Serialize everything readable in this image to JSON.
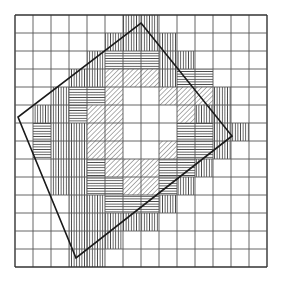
{
  "figure": {
    "background_color": "#ffffff",
    "grid": {
      "origin_x": 15,
      "origin_y": 15,
      "cell_size": 18,
      "cols": 14,
      "rows": 14,
      "line_color": "#555555",
      "line_width": 0.9,
      "border_color": "#333333",
      "border_width": 1.4
    },
    "polygon": {
      "name": "inscribed-quadrilateral",
      "stroke_color": "#1a1a1a",
      "stroke_width": 1.6,
      "fill": "none",
      "vertices": [
        {
          "label": "top",
          "x": 141,
          "y": 23
        },
        {
          "label": "right",
          "x": 232,
          "y": 136
        },
        {
          "label": "bottom",
          "x": 76,
          "y": 258
        },
        {
          "label": "left",
          "x": 18,
          "y": 117
        }
      ]
    },
    "hatch_styles": {
      "vertical": {
        "name": "vertical-hatch",
        "angle_deg": 90,
        "spacing": 2.6,
        "color": "#3a3a3a",
        "width": 0.8
      },
      "horizontal": {
        "name": "horizontal-hatch",
        "angle_deg": 0,
        "spacing": 2.6,
        "color": "#3a3a3a",
        "width": 0.8
      },
      "diagonal": {
        "name": "diagonal-hatch",
        "angle_deg": 45,
        "spacing": 3.4,
        "color": "#3a3a3a",
        "width": 0.8
      }
    },
    "hatched_cells": [
      {
        "col": 6,
        "row": 0,
        "pattern": "vertical"
      },
      {
        "col": 7,
        "row": 0,
        "pattern": "vertical"
      },
      {
        "col": 5,
        "row": 1,
        "pattern": "vertical"
      },
      {
        "col": 6,
        "row": 1,
        "pattern": "vertical"
      },
      {
        "col": 7,
        "row": 1,
        "pattern": "vertical"
      },
      {
        "col": 8,
        "row": 1,
        "pattern": "vertical"
      },
      {
        "col": 4,
        "row": 2,
        "pattern": "vertical"
      },
      {
        "col": 5,
        "row": 2,
        "pattern": "horizontal"
      },
      {
        "col": 6,
        "row": 2,
        "pattern": "horizontal"
      },
      {
        "col": 7,
        "row": 2,
        "pattern": "horizontal"
      },
      {
        "col": 8,
        "row": 2,
        "pattern": "vertical"
      },
      {
        "col": 9,
        "row": 2,
        "pattern": "vertical"
      },
      {
        "col": 3,
        "row": 3,
        "pattern": "vertical"
      },
      {
        "col": 4,
        "row": 3,
        "pattern": "vertical"
      },
      {
        "col": 5,
        "row": 3,
        "pattern": "diagonal"
      },
      {
        "col": 6,
        "row": 3,
        "pattern": "diagonal"
      },
      {
        "col": 7,
        "row": 3,
        "pattern": "diagonal"
      },
      {
        "col": 8,
        "row": 3,
        "pattern": "vertical"
      },
      {
        "col": 9,
        "row": 3,
        "pattern": "horizontal"
      },
      {
        "col": 10,
        "row": 3,
        "pattern": "horizontal"
      },
      {
        "col": 2,
        "row": 4,
        "pattern": "vertical"
      },
      {
        "col": 3,
        "row": 4,
        "pattern": "horizontal"
      },
      {
        "col": 4,
        "row": 4,
        "pattern": "horizontal"
      },
      {
        "col": 5,
        "row": 4,
        "pattern": "diagonal"
      },
      {
        "col": 8,
        "row": 4,
        "pattern": "diagonal"
      },
      {
        "col": 9,
        "row": 4,
        "pattern": "diagonal"
      },
      {
        "col": 10,
        "row": 4,
        "pattern": "diagonal"
      },
      {
        "col": 11,
        "row": 4,
        "pattern": "vertical"
      },
      {
        "col": 1,
        "row": 5,
        "pattern": "vertical"
      },
      {
        "col": 2,
        "row": 5,
        "pattern": "vertical"
      },
      {
        "col": 3,
        "row": 5,
        "pattern": "horizontal"
      },
      {
        "col": 4,
        "row": 5,
        "pattern": "diagonal"
      },
      {
        "col": 5,
        "row": 5,
        "pattern": "diagonal"
      },
      {
        "col": 9,
        "row": 5,
        "pattern": "diagonal"
      },
      {
        "col": 10,
        "row": 5,
        "pattern": "vertical"
      },
      {
        "col": 11,
        "row": 5,
        "pattern": "vertical"
      },
      {
        "col": 1,
        "row": 6,
        "pattern": "horizontal"
      },
      {
        "col": 2,
        "row": 6,
        "pattern": "vertical"
      },
      {
        "col": 3,
        "row": 6,
        "pattern": "vertical"
      },
      {
        "col": 4,
        "row": 6,
        "pattern": "diagonal"
      },
      {
        "col": 5,
        "row": 6,
        "pattern": "diagonal"
      },
      {
        "col": 9,
        "row": 6,
        "pattern": "horizontal"
      },
      {
        "col": 10,
        "row": 6,
        "pattern": "horizontal"
      },
      {
        "col": 11,
        "row": 6,
        "pattern": "vertical"
      },
      {
        "col": 12,
        "row": 6,
        "pattern": "vertical"
      },
      {
        "col": 1,
        "row": 7,
        "pattern": "horizontal"
      },
      {
        "col": 2,
        "row": 7,
        "pattern": "vertical"
      },
      {
        "col": 3,
        "row": 7,
        "pattern": "vertical"
      },
      {
        "col": 4,
        "row": 7,
        "pattern": "diagonal"
      },
      {
        "col": 5,
        "row": 7,
        "pattern": "diagonal"
      },
      {
        "col": 8,
        "row": 7,
        "pattern": "diagonal"
      },
      {
        "col": 9,
        "row": 7,
        "pattern": "horizontal"
      },
      {
        "col": 10,
        "row": 7,
        "pattern": "horizontal"
      },
      {
        "col": 11,
        "row": 7,
        "pattern": "vertical"
      },
      {
        "col": 2,
        "row": 8,
        "pattern": "vertical"
      },
      {
        "col": 3,
        "row": 8,
        "pattern": "vertical"
      },
      {
        "col": 4,
        "row": 8,
        "pattern": "horizontal"
      },
      {
        "col": 5,
        "row": 8,
        "pattern": "diagonal"
      },
      {
        "col": 6,
        "row": 8,
        "pattern": "diagonal"
      },
      {
        "col": 7,
        "row": 8,
        "pattern": "diagonal"
      },
      {
        "col": 8,
        "row": 8,
        "pattern": "horizontal"
      },
      {
        "col": 9,
        "row": 8,
        "pattern": "horizontal"
      },
      {
        "col": 10,
        "row": 8,
        "pattern": "vertical"
      },
      {
        "col": 2,
        "row": 9,
        "pattern": "vertical"
      },
      {
        "col": 3,
        "row": 9,
        "pattern": "vertical"
      },
      {
        "col": 4,
        "row": 9,
        "pattern": "horizontal"
      },
      {
        "col": 5,
        "row": 9,
        "pattern": "horizontal"
      },
      {
        "col": 6,
        "row": 9,
        "pattern": "diagonal"
      },
      {
        "col": 7,
        "row": 9,
        "pattern": "diagonal"
      },
      {
        "col": 8,
        "row": 9,
        "pattern": "horizontal"
      },
      {
        "col": 9,
        "row": 9,
        "pattern": "vertical"
      },
      {
        "col": 3,
        "row": 10,
        "pattern": "vertical"
      },
      {
        "col": 4,
        "row": 10,
        "pattern": "vertical"
      },
      {
        "col": 5,
        "row": 10,
        "pattern": "horizontal"
      },
      {
        "col": 6,
        "row": 10,
        "pattern": "horizontal"
      },
      {
        "col": 7,
        "row": 10,
        "pattern": "horizontal"
      },
      {
        "col": 8,
        "row": 10,
        "pattern": "vertical"
      },
      {
        "col": 3,
        "row": 11,
        "pattern": "vertical"
      },
      {
        "col": 4,
        "row": 11,
        "pattern": "vertical"
      },
      {
        "col": 5,
        "row": 11,
        "pattern": "vertical"
      },
      {
        "col": 6,
        "row": 11,
        "pattern": "vertical"
      },
      {
        "col": 7,
        "row": 11,
        "pattern": "vertical"
      },
      {
        "col": 3,
        "row": 12,
        "pattern": "vertical"
      },
      {
        "col": 4,
        "row": 12,
        "pattern": "vertical"
      },
      {
        "col": 5,
        "row": 12,
        "pattern": "vertical"
      },
      {
        "col": 3,
        "row": 13,
        "pattern": "vertical"
      },
      {
        "col": 4,
        "row": 13,
        "pattern": "vertical"
      }
    ]
  }
}
